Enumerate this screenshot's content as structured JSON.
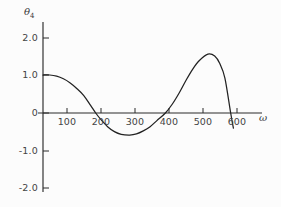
{
  "chart_data": {
    "type": "line",
    "title": "",
    "xlabel": "ω",
    "ylabel": "θ",
    "ylabel_sub": "4",
    "xlim": [
      0,
      660
    ],
    "ylim": [
      -2.0,
      2.3
    ],
    "grid": false,
    "legend": null,
    "xticks": [
      100,
      200,
      300,
      400,
      500,
      600
    ],
    "xtick_labels": [
      "100",
      "200",
      "300",
      "400",
      "500",
      "600"
    ],
    "yticks": [
      2.0,
      1.0,
      0,
      -1.0,
      -2.0
    ],
    "ytick_labels": [
      "2.0",
      "1.0",
      "0",
      "-1.0",
      "-2.0"
    ],
    "series": [
      {
        "name": "theta_4",
        "color": "#222222",
        "x": [
          0,
          20,
          40,
          60,
          80,
          100,
          120,
          140,
          155,
          170,
          190,
          210,
          230,
          255,
          275,
          295,
          315,
          335,
          360,
          380,
          400,
          420,
          440,
          460,
          485,
          505,
          520,
          535,
          552,
          560
        ],
        "y": [
          1.0,
          1.0,
          0.97,
          0.9,
          0.79,
          0.64,
          0.46,
          0.2,
          0.0,
          -0.17,
          -0.36,
          -0.49,
          -0.56,
          -0.58,
          -0.55,
          -0.47,
          -0.36,
          -0.2,
          0.0,
          0.23,
          0.52,
          0.85,
          1.15,
          1.38,
          1.55,
          1.5,
          1.3,
          0.92,
          0.0,
          -0.4
        ]
      }
    ],
    "annotations": {
      "zero_crossings": [
        155,
        360,
        552
      ],
      "minimum": {
        "x": 255,
        "y": -0.58
      },
      "maximum": {
        "x": 485,
        "y": 1.55
      },
      "start_value": 1.0,
      "end_value": -0.4
    }
  },
  "axis": {
    "y_title": "θ",
    "y_title_sub": "4",
    "x_title": "ω"
  }
}
